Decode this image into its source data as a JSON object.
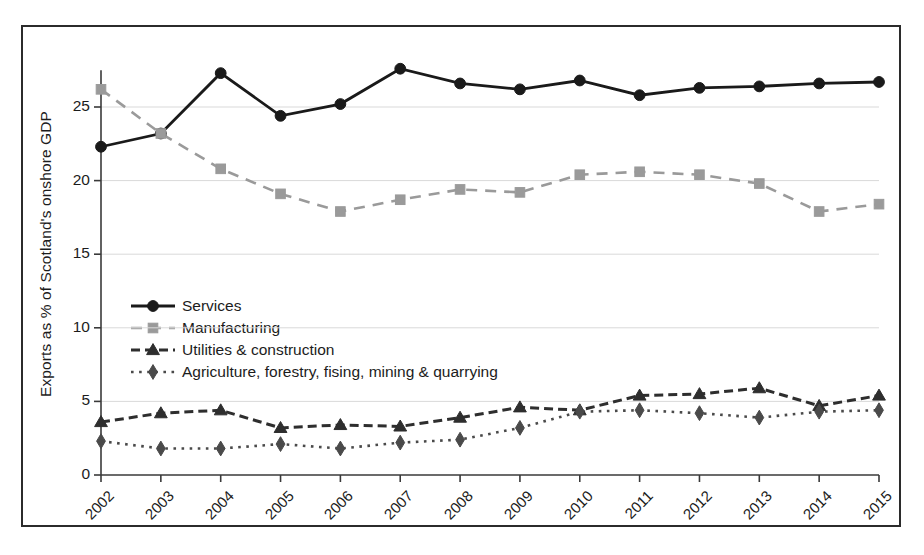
{
  "chart_data": {
    "type": "line",
    "title": "",
    "xlabel": "",
    "ylabel": "Exports as % of Scotland's onshore GDP",
    "categories": [
      "2002",
      "2003",
      "2004",
      "2005",
      "2006",
      "2007",
      "2008",
      "2009",
      "2010",
      "2011",
      "2012",
      "2013",
      "2014",
      "2015"
    ],
    "x": [
      2002,
      2003,
      2004,
      2005,
      2006,
      2007,
      2008,
      2009,
      2010,
      2011,
      2012,
      2013,
      2014,
      2015
    ],
    "ylim": [
      0,
      27.5
    ],
    "yticks": [
      0,
      5,
      10,
      15,
      20,
      25
    ],
    "ytick_labels": [
      "0",
      "5",
      "10",
      "15",
      "20",
      "25"
    ],
    "grid": "horizontal",
    "legend_position": "center-left inside axes",
    "series": [
      {
        "name": "Services",
        "color": "#1a1a1a",
        "marker": "circle",
        "linestyle": "solid",
        "values": [
          22.3,
          23.2,
          27.3,
          24.4,
          25.2,
          27.6,
          26.6,
          26.2,
          26.8,
          25.8,
          26.3,
          26.4,
          26.6,
          26.7
        ]
      },
      {
        "name": "Manufacturing",
        "color": "#9a9a9a",
        "marker": "square",
        "linestyle": "dashed",
        "values": [
          26.2,
          23.2,
          20.8,
          19.1,
          17.9,
          18.7,
          19.4,
          19.2,
          20.4,
          20.6,
          20.4,
          19.8,
          17.9,
          18.4
        ]
      },
      {
        "name": "Utilities & construction",
        "color": "#2e2e2e",
        "marker": "triangle",
        "linestyle": "dashed-bold",
        "values": [
          3.6,
          4.2,
          4.4,
          3.2,
          3.4,
          3.3,
          3.9,
          4.6,
          4.4,
          5.4,
          5.5,
          5.9,
          4.7,
          5.4
        ]
      },
      {
        "name": "Agriculture, forestry, fising, mining & quarrying",
        "color": "#4a4a4a",
        "marker": "diamond",
        "linestyle": "dotted",
        "values": [
          2.3,
          1.8,
          1.8,
          2.1,
          1.8,
          2.2,
          2.4,
          3.2,
          4.3,
          4.4,
          4.2,
          3.9,
          4.3,
          4.4
        ]
      }
    ],
    "legend_entries": [
      "Services",
      "Manufacturing",
      "Utilities & construction",
      "Agriculture, forestry, fising, mining & quarrying"
    ]
  }
}
